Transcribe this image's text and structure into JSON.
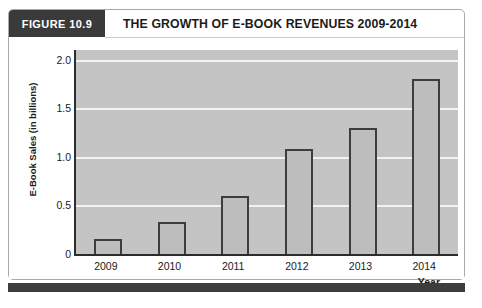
{
  "figure": {
    "badge_label": "FIGURE 10.9",
    "title": "THE GROWTH OF E-BOOK REVENUES 2009-2014"
  },
  "colors": {
    "badge_bg": "#3a3a3a",
    "plot_bg": "#c4c4c4",
    "bar_fill": "#bdbdbd",
    "bar_outline": "#3d3d3d",
    "gridline": "#f2f2f2",
    "axis": "#2c2c2c",
    "card_border": "#a9a9a9",
    "footer_strip": "#3d3d3d"
  },
  "chart_data": {
    "type": "bar",
    "title": "THE GROWTH OF E-BOOK REVENUES 2009-2014",
    "xlabel": "Year",
    "ylabel": "E-Book Sales (in billions)",
    "categories": [
      "2009",
      "2010",
      "2011",
      "2012",
      "2013",
      "2014"
    ],
    "values": [
      0.15,
      0.33,
      0.6,
      1.08,
      1.3,
      1.8
    ],
    "ylim": [
      0,
      2.1
    ],
    "yticks": [
      0,
      0.5,
      1.0,
      1.5,
      2.0
    ],
    "ytick_labels": [
      "0",
      "0.5",
      "1.0",
      "1.5",
      "2.0"
    ],
    "grid": "horizontal",
    "legend": "none",
    "series": [
      {
        "name": "E-Book Sales (in billions)",
        "values": [
          0.15,
          0.33,
          0.6,
          1.08,
          1.3,
          1.8
        ]
      }
    ]
  }
}
